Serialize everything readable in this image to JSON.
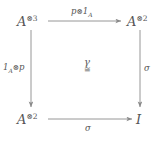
{
  "diagram": {
    "type": "commutative-square",
    "nodes": {
      "top_left": {
        "base": "A",
        "sup": "⊗3"
      },
      "top_right": {
        "base": "A",
        "sup": "⊗2"
      },
      "bottom_left": {
        "base": "A",
        "sup": "⊗2"
      },
      "bottom_right": {
        "base": "I",
        "sup": ""
      }
    },
    "edges": {
      "top": {
        "base": "p",
        "op": "⊗",
        "tail": "1",
        "sub": "A"
      },
      "left": {
        "base": "1",
        "sub": "A",
        "op": "⊗",
        "tail": "p"
      },
      "right": {
        "label": "σ"
      },
      "bottom": {
        "label": "σ"
      }
    },
    "cell": {
      "name": "γ",
      "iso": "≅"
    },
    "colors": {
      "background": "#ffffff",
      "ink": "#555555",
      "arrow": "#8a8a8a"
    }
  }
}
